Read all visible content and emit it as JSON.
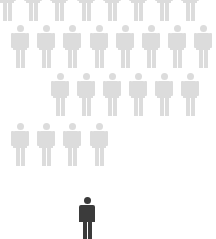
{
  "colors": {
    "background": "#ffffff",
    "crowd_figure": "#dcdcdc",
    "highlighted_figure": "#3b3b3b"
  },
  "figures": {
    "crowd_rows": [
      {
        "row": 1,
        "count": 8,
        "head_y": -22,
        "centers_x": [
          7,
          33,
          59,
          86,
          112,
          138,
          164,
          190
        ]
      },
      {
        "row": 2,
        "count": 8,
        "head_y": 25,
        "centers_x": [
          20,
          46,
          72,
          99,
          125,
          151,
          177,
          203
        ]
      },
      {
        "row": 3,
        "count": 6,
        "head_y": 73,
        "centers_x": [
          60,
          86,
          112,
          138,
          164,
          190
        ]
      },
      {
        "row": 4,
        "count": 4,
        "head_y": 123,
        "centers_x": [
          20,
          46,
          72,
          99
        ]
      }
    ],
    "highlighted": {
      "count": 1,
      "head_y": 197,
      "center_x": 87
    }
  }
}
